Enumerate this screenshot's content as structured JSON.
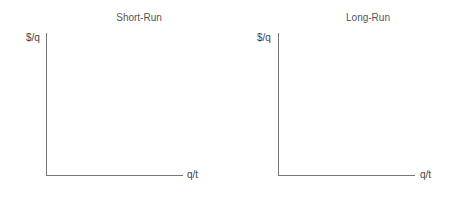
{
  "panels": [
    {
      "title": "Short-Run",
      "y_label": "$/q",
      "x_label": "q/t"
    },
    {
      "title": "Long-Run",
      "y_label": "$/q",
      "x_label": "q/t"
    }
  ],
  "colors": {
    "axis": "#777777",
    "text": "#555555",
    "background": "#ffffff"
  }
}
